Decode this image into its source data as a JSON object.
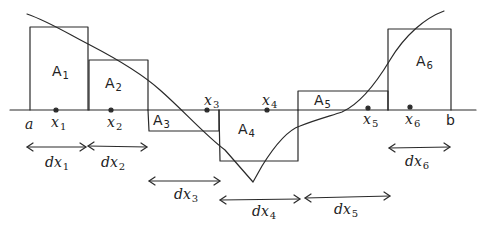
{
  "diagram": {
    "axis_endpoints": {
      "left": "a",
      "right": "b"
    },
    "sample_points": [
      {
        "base": "x",
        "sub": "1"
      },
      {
        "base": "x",
        "sub": "2"
      },
      {
        "base": "x",
        "sub": "3"
      },
      {
        "base": "x",
        "sub": "4"
      },
      {
        "base": "x",
        "sub": "5"
      },
      {
        "base": "x",
        "sub": "6"
      }
    ],
    "areas": [
      {
        "base": "A",
        "sub": "1",
        "sign": "positive"
      },
      {
        "base": "A",
        "sub": "2",
        "sign": "positive"
      },
      {
        "base": "A",
        "sub": "3",
        "sign": "negative"
      },
      {
        "base": "A",
        "sub": "4",
        "sign": "negative"
      },
      {
        "base": "A",
        "sub": "5",
        "sign": "positive"
      },
      {
        "base": "A",
        "sub": "6",
        "sign": "positive"
      }
    ],
    "widths": [
      {
        "base": "dx",
        "sub": "1"
      },
      {
        "base": "dx",
        "sub": "2"
      },
      {
        "base": "dx",
        "sub": "3"
      },
      {
        "base": "dx",
        "sub": "4"
      },
      {
        "base": "dx",
        "sub": "5"
      },
      {
        "base": "dx",
        "sub": "6"
      }
    ],
    "stroke_color": "#2a2a2a",
    "background": "#ffffff"
  }
}
